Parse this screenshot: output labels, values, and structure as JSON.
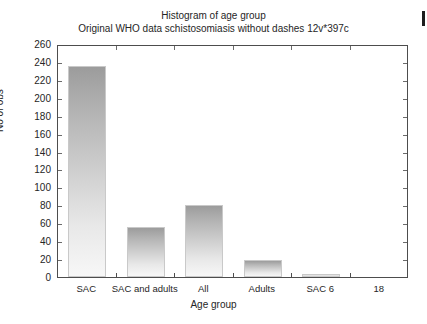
{
  "chart_data": {
    "type": "bar",
    "title": "Histogram of age group",
    "subtitle": "Original WHO data schistosomiasis without dashes 12v*397c",
    "xlabel": "Age group",
    "ylabel": "No of obs",
    "categories": [
      "SAC",
      "SAC and adults",
      "All",
      "Adults",
      "SAC 6",
      "18"
    ],
    "values": [
      236,
      56,
      80,
      19,
      3,
      0
    ],
    "ylim": [
      0,
      260
    ],
    "ytick_step": 20,
    "yticks": [
      0,
      20,
      40,
      60,
      80,
      100,
      120,
      140,
      160,
      180,
      200,
      220,
      240,
      260
    ],
    "grid": false,
    "legend": "none",
    "bar_fill_top": "#9c9c9c",
    "bar_fill_bottom": "#f7f7f7",
    "bar_border": "#c9c9c9",
    "axis_color": "#4d4d4d",
    "background": "#ffffff"
  },
  "labels": {
    "edge_artifact": ""
  }
}
